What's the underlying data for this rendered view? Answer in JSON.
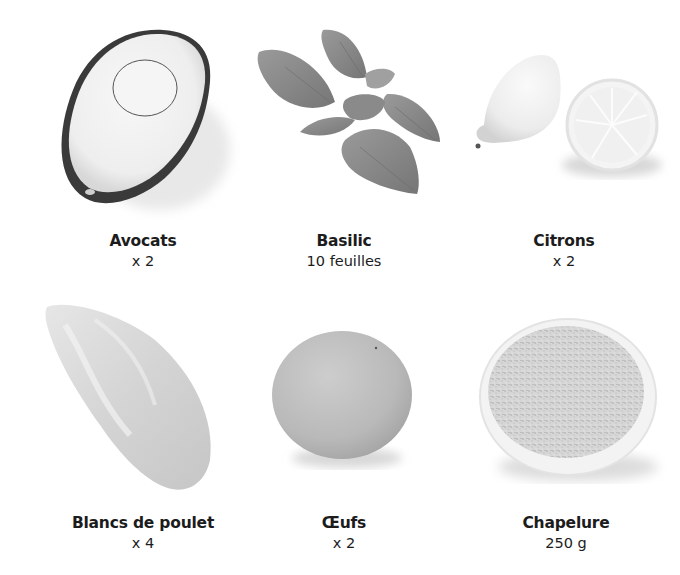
{
  "ingredients": [
    {
      "name": "Avocats",
      "quantity": "x 2",
      "icon": "avocado-image"
    },
    {
      "name": "Basilic",
      "quantity": "10 feuilles",
      "icon": "basil-image"
    },
    {
      "name": "Citrons",
      "quantity": "x 2",
      "icon": "lemon-image"
    },
    {
      "name": "Blancs de poulet",
      "quantity": "x 4",
      "icon": "chicken-breast-image"
    },
    {
      "name": "Œufs",
      "quantity": "x 2",
      "icon": "egg-image"
    },
    {
      "name": "Chapelure",
      "quantity": "250 g",
      "icon": "breadcrumbs-image"
    }
  ],
  "colors": {
    "background": "#ffffff",
    "text": "#1c1c1c"
  }
}
